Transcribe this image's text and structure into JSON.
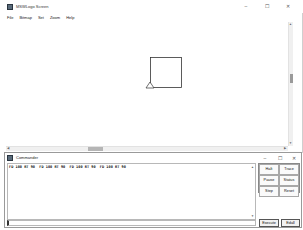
{
  "screen_window": {
    "title": "MSWLogo Screen",
    "controls": {
      "minimize": "–",
      "maximize": "☐",
      "close": "✕"
    },
    "menu": [
      "File",
      "Bitmap",
      "Set",
      "Zoom",
      "Help"
    ],
    "canvas": {
      "drawing": "square",
      "square": {
        "x": 150,
        "y": 57,
        "size": 31,
        "stroke": "#333333"
      },
      "turtle": {
        "x": 150,
        "y": 87,
        "heading": 0
      }
    },
    "scrollbars": {
      "horizontal": {
        "thumb_left": 88,
        "thumb_width": 15
      },
      "vertical": {
        "thumb_top": 74,
        "thumb_height": 9
      }
    }
  },
  "commander": {
    "title": "Commander",
    "controls": {
      "minimize": "–",
      "maximize": "☐",
      "close": "✕"
    },
    "history": [
      "FD 100 RT 90  FD 100 RT 90  FD 100 RT 90  FD 100 RT 90"
    ],
    "input_value": "",
    "buttons": {
      "halt": "Halt",
      "trace": "Trace",
      "pause": "Pause",
      "status": "Status",
      "step": "Step",
      "reset": "Reset",
      "execute": "Execute",
      "edall": "Edall"
    }
  }
}
